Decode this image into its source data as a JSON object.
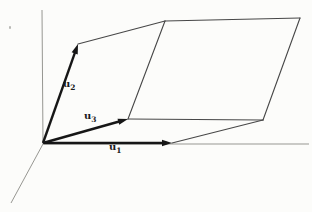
{
  "diagram": {
    "background": "#fcfcfa",
    "colors": {
      "vector": "#161616",
      "edge": "#474747",
      "axis": "#979792"
    },
    "axes": [
      {
        "name": "y-axis",
        "from": [
          42,
          10
        ],
        "to": [
          43,
          144
        ]
      },
      {
        "name": "x-axis",
        "from": [
          43,
          144
        ],
        "to": [
          309,
          144
        ]
      },
      {
        "name": "oblique-axis",
        "from": [
          43,
          144
        ],
        "to": [
          11,
          203
        ]
      }
    ],
    "vectors": [
      {
        "name": "u1",
        "from": [
          44,
          143
        ],
        "to": [
          172,
          143
        ],
        "label": "u",
        "subscript": "1"
      },
      {
        "name": "u2",
        "from": [
          43,
          143
        ],
        "to": [
          78,
          44
        ],
        "label": "u",
        "subscript": "2"
      },
      {
        "name": "u3",
        "from": [
          43,
          143
        ],
        "to": [
          128,
          119
        ],
        "label": "u",
        "subscript": "3"
      }
    ],
    "parallelepiped_edges": [
      {
        "name": "edge-u2tip-to-backtop",
        "from": [
          78,
          44
        ],
        "to": [
          165,
          21
        ]
      },
      {
        "name": "edge-top-far",
        "from": [
          165,
          21
        ],
        "to": [
          300,
          18
        ]
      },
      {
        "name": "edge-right-down",
        "from": [
          300,
          18
        ],
        "to": [
          263,
          120
        ]
      },
      {
        "name": "edge-mid-horizontal",
        "from": [
          128,
          119
        ],
        "to": [
          263,
          120
        ]
      },
      {
        "name": "edge-backtop-to-u3tip",
        "from": [
          165,
          21
        ],
        "to": [
          128,
          119
        ]
      },
      {
        "name": "edge-u1tip-to-rightmid",
        "from": [
          172,
          143
        ],
        "to": [
          263,
          120
        ]
      }
    ],
    "arrowhead": {
      "length": 10,
      "half_width": 3.2
    }
  }
}
